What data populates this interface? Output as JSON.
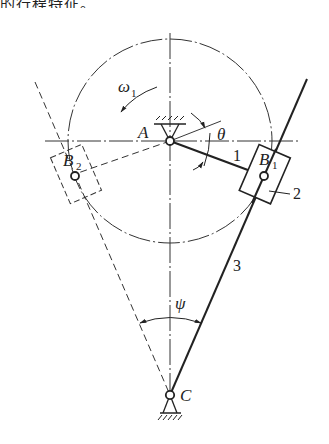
{
  "caption": {
    "text": "的行程特征。"
  },
  "diagram": {
    "labels": {
      "A": "A",
      "B1": "B",
      "B1_sub": "1",
      "B2": "B",
      "B2_sub": "2",
      "C": "C",
      "omega": "ω",
      "omega_sub": "1",
      "theta": "θ",
      "psi": "ψ",
      "link1": "1",
      "link2": "2",
      "link3": "3"
    },
    "colors": {
      "stroke": "#222222",
      "background": "#ffffff"
    }
  }
}
